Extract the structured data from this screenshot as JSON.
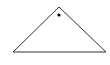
{
  "diagram": {
    "background": "#ffffff",
    "stroke_color": "#333333",
    "fill_color": "#000000",
    "triangle": {
      "apex": [
        59,
        7
      ],
      "base_left": [
        13,
        52
      ],
      "base_right": [
        106,
        52
      ],
      "stroke_width": 1
    },
    "dot": {
      "cx": 59,
      "cy": 15,
      "r": 1.6
    }
  }
}
